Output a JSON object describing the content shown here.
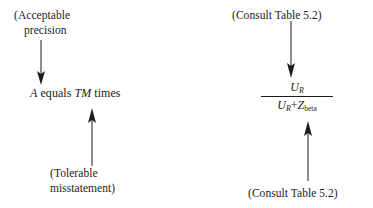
{
  "diagram": {
    "background_color": "#ffffff",
    "ink_color": "#1c1c1c",
    "left_group": {
      "callout_top": {
        "line1": "(Acceptable",
        "line2": "precision"
      },
      "equation": {
        "term_a": "A",
        "connector": "equals",
        "term_tm": "TM",
        "suffix": "times"
      },
      "callout_bottom": {
        "line1": "(Tolerable",
        "line2": "misstatement)"
      },
      "arrow_top": {
        "direction": "down",
        "name": "arrow-precision-down"
      },
      "arrow_bottom": {
        "direction": "up",
        "name": "arrow-tolerable-up"
      }
    },
    "right_group": {
      "callout_top": "(Consult Table 5.2)",
      "callout_bottom": "(Consult Table 5.2)",
      "fraction": {
        "numerator_base": "U",
        "numerator_subscript": "R",
        "denominator_first_base": "U",
        "denominator_first_subscript": "R",
        "denominator_operator": "+",
        "denominator_second_base": "Z",
        "denominator_second_subscript": "beta"
      },
      "arrow_top": {
        "direction": "down",
        "name": "arrow-consult-top-down"
      },
      "arrow_bottom": {
        "direction": "up",
        "name": "arrow-consult-bottom-up"
      }
    }
  }
}
